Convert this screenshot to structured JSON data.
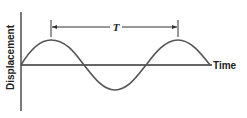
{
  "diagram": {
    "y_axis_label": "Displacement",
    "x_axis_label": "Time",
    "period_label": "T",
    "curve": "sine wave",
    "colors": {
      "line": "#555555",
      "axis": "#333333"
    }
  }
}
